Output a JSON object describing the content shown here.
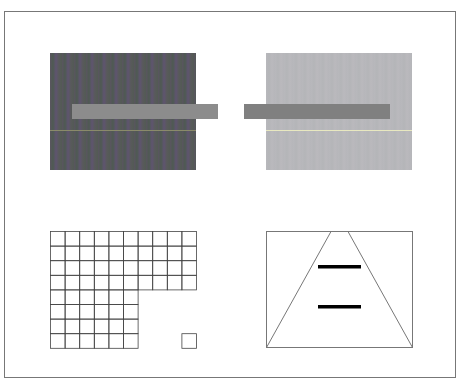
{
  "figure": {
    "colors": {
      "frame": "#777777",
      "dark_bg": "#555860",
      "light_bg": "#b7b7bb",
      "left_bar": "#8c8c8c",
      "right_bar": "#808080",
      "left_line": "#8a8a6a",
      "right_line": "#e8e8c0",
      "grid": "#444444",
      "triangle": "#777777",
      "ponzo_bars": "#000000"
    },
    "grid": {
      "cell": 14.6,
      "origin": [
        50,
        231
      ],
      "rows_full": 4,
      "cols_full": 10,
      "rows_partial": 4,
      "cols_partial": 6,
      "lone_square": {
        "col": 9,
        "row": 7
      }
    }
  }
}
